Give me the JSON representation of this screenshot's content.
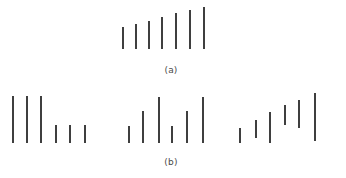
{
  "figure": {
    "width": 346,
    "height": 178,
    "background_color": "#ffffff",
    "stroke_color": "#3f3f3f",
    "stroke_width": 1.6
  },
  "chart_data": {
    "type": "bar",
    "title": "",
    "subtitle": "",
    "xlabel": "",
    "ylabel": "",
    "grid": false,
    "legend": null,
    "panels": [
      {
        "id": "a",
        "label": "(a)",
        "label_x": 171,
        "label_y": 65,
        "baseline_y": 49,
        "groups": [
          {
            "name": "ascending-run",
            "aligned": "bottom",
            "bars": [
              {
                "index": 1,
                "x": 123,
                "top": 27,
                "bottom": 49,
                "height": 22
              },
              {
                "index": 2,
                "x": 136,
                "top": 24,
                "bottom": 49,
                "height": 25
              },
              {
                "index": 3,
                "x": 149,
                "top": 21,
                "bottom": 49,
                "height": 28
              },
              {
                "index": 4,
                "x": 162,
                "top": 17,
                "bottom": 49,
                "height": 32
              },
              {
                "index": 5,
                "x": 176,
                "top": 13,
                "bottom": 49,
                "height": 36
              },
              {
                "index": 6,
                "x": 190,
                "top": 10,
                "bottom": 49,
                "height": 39
              },
              {
                "index": 7,
                "x": 204,
                "top": 7,
                "bottom": 49,
                "height": 42
              }
            ]
          }
        ]
      },
      {
        "id": "b",
        "label": "(b)",
        "label_x": 171,
        "label_y": 157,
        "baseline_y": 143,
        "groups": [
          {
            "name": "step-down-group",
            "aligned": "bottom",
            "bars": [
              {
                "index": 1,
                "x": 13,
                "top": 96,
                "bottom": 143,
                "height": 47
              },
              {
                "index": 2,
                "x": 27,
                "top": 96,
                "bottom": 143,
                "height": 47
              },
              {
                "index": 3,
                "x": 41,
                "top": 96,
                "bottom": 143,
                "height": 47
              },
              {
                "index": 4,
                "x": 56,
                "top": 125,
                "bottom": 143,
                "height": 18
              },
              {
                "index": 5,
                "x": 70,
                "top": 125,
                "bottom": 143,
                "height": 18
              },
              {
                "index": 6,
                "x": 85,
                "top": 125,
                "bottom": 143,
                "height": 18
              }
            ]
          },
          {
            "name": "alternating-group",
            "aligned": "bottom",
            "bars": [
              {
                "index": 1,
                "x": 129,
                "top": 126,
                "bottom": 143,
                "height": 17
              },
              {
                "index": 2,
                "x": 143,
                "top": 111,
                "bottom": 143,
                "height": 32
              },
              {
                "index": 3,
                "x": 159,
                "top": 97,
                "bottom": 143,
                "height": 46
              },
              {
                "index": 4,
                "x": 172,
                "top": 126,
                "bottom": 143,
                "height": 17
              },
              {
                "index": 5,
                "x": 187,
                "top": 111,
                "bottom": 143,
                "height": 32
              },
              {
                "index": 6,
                "x": 203,
                "top": 97,
                "bottom": 143,
                "height": 46
              }
            ]
          },
          {
            "name": "staircase-group",
            "aligned": "none",
            "bars": [
              {
                "index": 1,
                "x": 240,
                "top": 128,
                "bottom": 143,
                "height": 15
              },
              {
                "index": 2,
                "x": 256,
                "top": 120,
                "bottom": 138,
                "height": 18
              },
              {
                "index": 3,
                "x": 270,
                "top": 112,
                "bottom": 143,
                "height": 31
              },
              {
                "index": 4,
                "x": 285,
                "top": 105,
                "bottom": 125,
                "height": 20
              },
              {
                "index": 5,
                "x": 299,
                "top": 100,
                "bottom": 128,
                "height": 28
              },
              {
                "index": 6,
                "x": 315,
                "top": 93,
                "bottom": 141,
                "height": 48
              }
            ]
          }
        ]
      }
    ]
  }
}
